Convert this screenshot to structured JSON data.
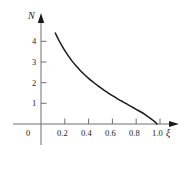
{
  "chart_data": {
    "type": "line",
    "title": "",
    "xlabel": "ξ",
    "ylabel": "N",
    "xlim": [
      0,
      1.12
    ],
    "ylim": [
      0,
      4.9
    ],
    "grid": false,
    "legend": null,
    "xticks": [
      0.2,
      0.4,
      0.6,
      0.8,
      1.0
    ],
    "xticklabels": [
      "0.2",
      "0.4",
      "0.6",
      "0.8",
      "1.0"
    ],
    "yticks": [
      1,
      2,
      3,
      4
    ],
    "yticklabels": [
      "1",
      "2",
      "3",
      "4"
    ],
    "origin_label": "0",
    "series": [
      {
        "name": "N(ξ)",
        "color": "#1a1a1a",
        "x": [
          0.12,
          0.15,
          0.18,
          0.21,
          0.24,
          0.27,
          0.3,
          0.33,
          0.36,
          0.4,
          0.44,
          0.48,
          0.52,
          0.56,
          0.6,
          0.64,
          0.68,
          0.72,
          0.76,
          0.8,
          0.84,
          0.88,
          0.91,
          0.94,
          0.96,
          0.975
        ],
        "y": [
          4.4,
          4.05,
          3.74,
          3.46,
          3.21,
          2.98,
          2.78,
          2.59,
          2.42,
          2.21,
          2.02,
          1.84,
          1.67,
          1.52,
          1.37,
          1.23,
          1.1,
          0.97,
          0.84,
          0.71,
          0.58,
          0.43,
          0.31,
          0.18,
          0.09,
          0.0
        ]
      }
    ]
  },
  "axes": {
    "x_axis_name": "xi",
    "y_axis_name": "N"
  }
}
